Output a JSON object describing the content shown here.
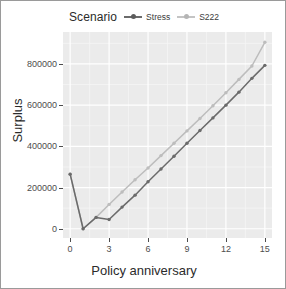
{
  "legend": {
    "title": "Scenario",
    "position": "top",
    "items": [
      {
        "label": "Stress",
        "color": "#6b6b6b"
      },
      {
        "label": "S222",
        "color": "#bdbdbd"
      }
    ]
  },
  "axes": {
    "x_title": "Policy anniversary",
    "y_title": "Surplus",
    "x_ticks": [
      "0",
      "3",
      "6",
      "9",
      "12",
      "15"
    ],
    "y_ticks": [
      "0",
      "200000",
      "400000",
      "600000",
      "800000"
    ]
  },
  "panel": {
    "background": "#ebebeb",
    "gridline_major": "#ffffff",
    "gridline_minor": "#f5f5f5"
  },
  "chart_data": {
    "type": "line",
    "title": "",
    "subtitle": "",
    "xlabel": "Policy anniversary",
    "ylabel": "Surplus",
    "legend_title": "Scenario",
    "legend_position": "top",
    "grid": true,
    "xlim": [
      -0.55,
      15.55
    ],
    "ylim": [
      -45000,
      955000
    ],
    "x_ticks": [
      0,
      3,
      6,
      9,
      12,
      15
    ],
    "y_ticks": [
      0,
      200000,
      400000,
      600000,
      800000
    ],
    "x": [
      0,
      1,
      2,
      3,
      4,
      5,
      6,
      7,
      8,
      9,
      10,
      11,
      12,
      13,
      14,
      15
    ],
    "series": [
      {
        "name": "Stress",
        "color": "#6b6b6b",
        "marker": "circle",
        "values": [
          265000,
          0,
          55000,
          45000,
          105000,
          163000,
          228000,
          290000,
          352000,
          415000,
          477000,
          538000,
          600000,
          663000,
          730000,
          793000
        ]
      },
      {
        "name": "S222",
        "color": "#bdbdbd",
        "marker": "circle",
        "values": [
          265000,
          0,
          55000,
          118000,
          178000,
          238000,
          295000,
          355000,
          415000,
          475000,
          535000,
          597000,
          660000,
          725000,
          790000,
          905000
        ]
      }
    ]
  }
}
